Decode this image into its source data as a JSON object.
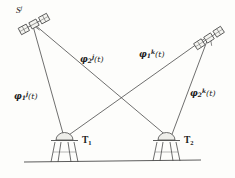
{
  "figure": {
    "kind": "gnss-double-difference-geometry-diagram",
    "stroke_color": "#4a4a4a",
    "text_color": "#1a1a1a",
    "background_color": "#fdfdfb"
  },
  "satellites": [
    {
      "id": "satellite-j",
      "label_base": "S",
      "label_sup": "j",
      "x": 34,
      "y": 24,
      "rotation_deg": -28
    },
    {
      "id": "satellite-k",
      "label_base": "",
      "label_sup": "",
      "x": 209,
      "y": 38,
      "rotation_deg": -33
    }
  ],
  "stations": [
    {
      "id": "station-t1",
      "label_base": "T",
      "label_sub": "1",
      "x": 65,
      "y": 142
    },
    {
      "id": "station-t2",
      "label_base": "T",
      "label_sub": "2",
      "x": 167,
      "y": 142
    }
  ],
  "ground": {
    "x1": 24,
    "y1": 162,
    "x2": 201,
    "y2": 160
  },
  "paths": [
    {
      "id": "path-phi-1-j",
      "from": "satellite-j",
      "to": "station-t1",
      "label_base": "φ",
      "label_sub": "1",
      "label_sup": "j",
      "label_arg": "(t)",
      "label_x": 14,
      "label_y": 91
    },
    {
      "id": "path-phi-2-j",
      "from": "satellite-j",
      "to": "station-t2",
      "label_base": "φ",
      "label_sub": "2",
      "label_sup": "j",
      "label_arg": "(t)",
      "label_x": 80,
      "label_y": 54
    },
    {
      "id": "path-phi-1-k",
      "from": "satellite-k",
      "to": "station-t1",
      "label_base": "φ",
      "label_sub": "1",
      "label_sup": "k",
      "label_arg": "(t)",
      "label_x": 139,
      "label_y": 49
    },
    {
      "id": "path-phi-2-k",
      "from": "satellite-k",
      "to": "station-t2",
      "label_base": "φ",
      "label_sub": "2",
      "label_sup": "k",
      "label_arg": "(t)",
      "label_x": 190,
      "label_y": 88
    }
  ]
}
